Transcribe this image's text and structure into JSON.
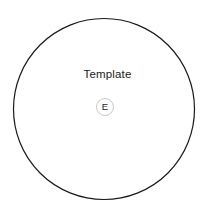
{
  "diagram": {
    "background_color": "#ffffff",
    "boundary": {
      "name": "template-boundary-circle",
      "shape": "circle",
      "center_x": 104,
      "center_y": 109,
      "radius": 90.5,
      "stroke_color": "#1a1a1a",
      "stroke_width": 1.2,
      "fill_color": "#ffffff"
    },
    "title": "Template",
    "badge": {
      "letter": "E",
      "stroke_color": "#c9c9c9",
      "fill_color": "#ffffff",
      "text_color": "#1a1a1a",
      "diameter": 18
    }
  }
}
